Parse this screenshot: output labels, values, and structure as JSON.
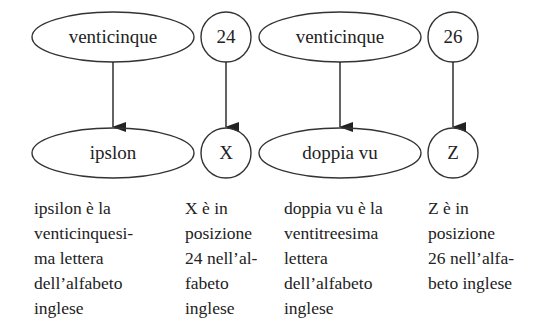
{
  "diagram": {
    "columns": [
      {
        "top": {
          "label": "venticinque",
          "shape": "ellipse"
        },
        "bottom": {
          "label": "ipslon",
          "shape": "ellipse"
        },
        "caption": [
          "ipsilon è la",
          "venticinquesi-",
          "ma lettera",
          "dell’alfabeto",
          "inglese"
        ]
      },
      {
        "top": {
          "label": "24",
          "shape": "circle"
        },
        "bottom": {
          "label": "X",
          "shape": "circle"
        },
        "caption": [
          "X è in",
          "posizione",
          "24 nell’al-",
          "fabeto",
          "inglese"
        ]
      },
      {
        "top": {
          "label": "venticinque",
          "shape": "ellipse"
        },
        "bottom": {
          "label": "doppia vu",
          "shape": "ellipse"
        },
        "caption": [
          "doppia vu è la",
          "ventitreesima",
          "lettera",
          "dell’alfabeto",
          "inglese"
        ]
      },
      {
        "top": {
          "label": "26",
          "shape": "circle"
        },
        "bottom": {
          "label": "Z",
          "shape": "circle"
        },
        "caption": [
          "Z è in",
          "posizione",
          "26 nell’alfa-",
          "beto inglese"
        ]
      }
    ],
    "colors": {
      "stroke": "#333333",
      "text": "#222222",
      "background": "#ffffff"
    }
  }
}
